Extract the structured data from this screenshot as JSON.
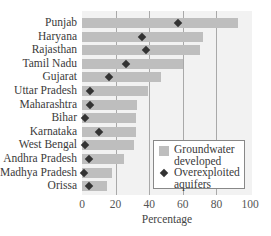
{
  "chart_data": {
    "type": "bar",
    "orientation": "horizontal",
    "title": "",
    "xlabel": "Percentage",
    "ylabel": "",
    "xlim": [
      0,
      100
    ],
    "xticks": [
      0,
      20,
      40,
      60,
      80,
      100
    ],
    "grid": true,
    "legend_position": "lower right",
    "categories": [
      "Punjab",
      "Haryana",
      "Rajasthan",
      "Tamil Nadu",
      "Gujarat",
      "Uttar Pradesh",
      "Maharashtra",
      "Bihar",
      "Karnataka",
      "West Bengal",
      "Andhra Pradesh",
      "Madhya Pradesh",
      "Orissa"
    ],
    "series": [
      {
        "name": "Groundwater developed",
        "kind": "bar",
        "color": "#bebebe",
        "values": [
          93,
          72,
          70,
          60,
          47,
          39,
          33,
          32,
          32,
          31,
          25,
          18,
          15
        ]
      },
      {
        "name": "Overexploited aquifers",
        "kind": "diamond-marker",
        "color": "#333333",
        "values": [
          57,
          36,
          38,
          26,
          16,
          5,
          5,
          2,
          10,
          2,
          4,
          1,
          4
        ]
      }
    ]
  },
  "legend": {
    "items": [
      {
        "line1": "Groundwater",
        "line2": "developed"
      },
      {
        "line1": "Overexploited",
        "line2": "aquifers"
      }
    ]
  },
  "axis": {
    "xlabel": "Percentage",
    "ticks": [
      "0",
      "20",
      "40",
      "60",
      "80",
      "100"
    ]
  }
}
